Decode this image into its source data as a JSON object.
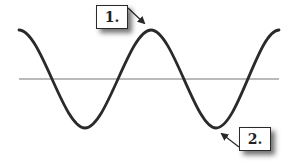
{
  "diagram": {
    "type": "sine-wave",
    "colors": {
      "wave": "#2a2a2a",
      "axis": "#777777",
      "box_border": "#2a2a2a",
      "background": "#ffffff"
    },
    "labels": [
      {
        "id": "1",
        "text": "1.",
        "points_to": "crest"
      },
      {
        "id": "2",
        "text": "2.",
        "points_to": "trough"
      }
    ]
  }
}
